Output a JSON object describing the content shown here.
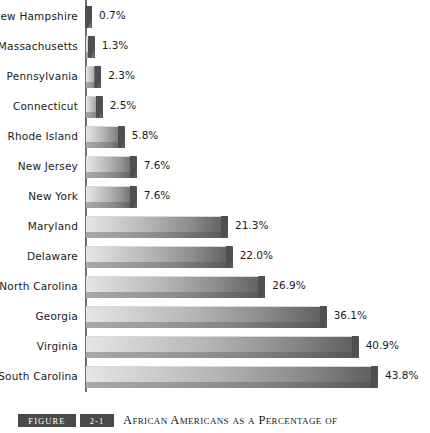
{
  "chart_data": {
    "type": "bar",
    "orientation": "horizontal",
    "title": "African Americans as a Percentage of",
    "xlabel": "",
    "ylabel": "",
    "xlim": [
      0,
      43.8
    ],
    "grid": false,
    "legend": "none",
    "value_suffix": "%",
    "categories": [
      "New Hampshire",
      "Massachusetts",
      "Pennsylvania",
      "Connecticut",
      "Rhode Island",
      "New Jersey",
      "New York",
      "Maryland",
      "Delaware",
      "North Carolina",
      "Georgia",
      "Virginia",
      "South Carolina"
    ],
    "values": [
      0.7,
      1.3,
      2.3,
      2.5,
      5.8,
      7.6,
      7.6,
      21.3,
      22.0,
      26.9,
      36.1,
      40.9,
      43.8
    ],
    "value_labels": [
      "0.7%",
      "1.3%",
      "2.3%",
      "2.5%",
      "5.8%",
      "7.6%",
      "7.6%",
      "21.3%",
      "22.0%",
      "26.9%",
      "36.1%",
      "40.9%",
      "43.8%"
    ],
    "bars": [
      {
        "label": "New Hampshire",
        "value": 0.7,
        "value_label": "0.7%"
      },
      {
        "label": "Massachusetts",
        "value": 1.3,
        "value_label": "1.3%"
      },
      {
        "label": "Pennsylvania",
        "value": 2.3,
        "value_label": "2.3%"
      },
      {
        "label": "Connecticut",
        "value": 2.5,
        "value_label": "2.5%"
      },
      {
        "label": "Rhode Island",
        "value": 5.8,
        "value_label": "5.8%"
      },
      {
        "label": "New Jersey",
        "value": 7.6,
        "value_label": "7.6%"
      },
      {
        "label": "New York",
        "value": 7.6,
        "value_label": "7.6%"
      },
      {
        "label": "Maryland",
        "value": 21.3,
        "value_label": "21.3%"
      },
      {
        "label": "Delaware",
        "value": 22.0,
        "value_label": "22.0%"
      },
      {
        "label": "North Carolina",
        "value": 26.9,
        "value_label": "26.9%"
      },
      {
        "label": "Georgia",
        "value": 36.1,
        "value_label": "36.1%"
      },
      {
        "label": "Virginia",
        "value": 40.9,
        "value_label": "40.9%"
      },
      {
        "label": "South Carolina",
        "value": 43.8,
        "value_label": "43.8%"
      }
    ],
    "colors": {
      "bar_light": "#e6e6e6",
      "bar_dark": "#5c5c5c",
      "bar_bevel": "#7d7d7d",
      "axis": "#6f6f6f",
      "text": "#1a1a1a",
      "caption_box": "#4a4a4a"
    }
  },
  "caption": {
    "figure_word": "Figure",
    "figure_number": "2-1",
    "title": "African Americans as a Percentage of"
  }
}
